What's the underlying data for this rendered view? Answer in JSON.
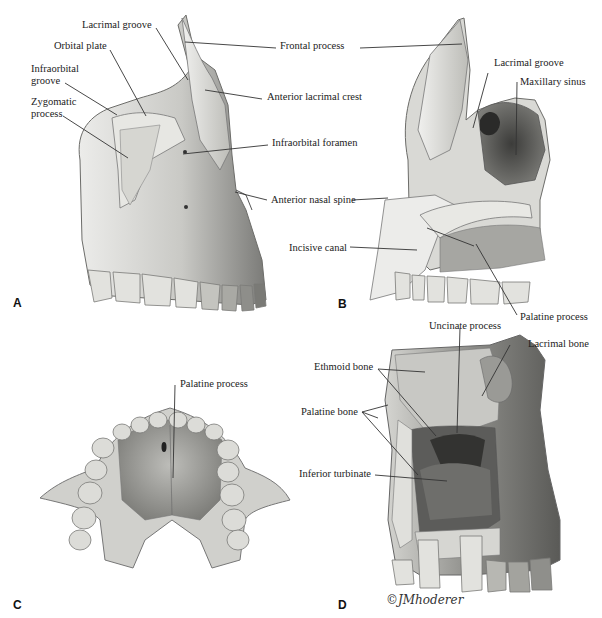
{
  "figure": {
    "subject": "Maxilla",
    "colors": {
      "bone_light": "#e6e6e2",
      "bone_mid": "#b9b9b4",
      "bone_dark": "#6f6f6c",
      "cavity": "#4a4a48",
      "leader": "#333333"
    },
    "panels": [
      {
        "letter": "A",
        "labels": [
          "Lacrimal groove",
          "Orbital plate",
          "Infraorbital groove",
          "Zygomatic process",
          "Frontal process",
          "Anterior lacrimal crest",
          "Infraorbital foramen",
          "Anterior nasal spine"
        ]
      },
      {
        "letter": "B",
        "labels": [
          "Lacrimal groove",
          "Maxillary sinus",
          "Incisive canal",
          "Palatine process"
        ]
      },
      {
        "letter": "C",
        "labels": [
          "Palatine process"
        ]
      },
      {
        "letter": "D",
        "labels": [
          "Uncinate process",
          "Lacrimal bone",
          "Ethmoid bone",
          "Palatine bone",
          "Inferior turbinate"
        ]
      }
    ],
    "signature": "©JMhoderer"
  }
}
